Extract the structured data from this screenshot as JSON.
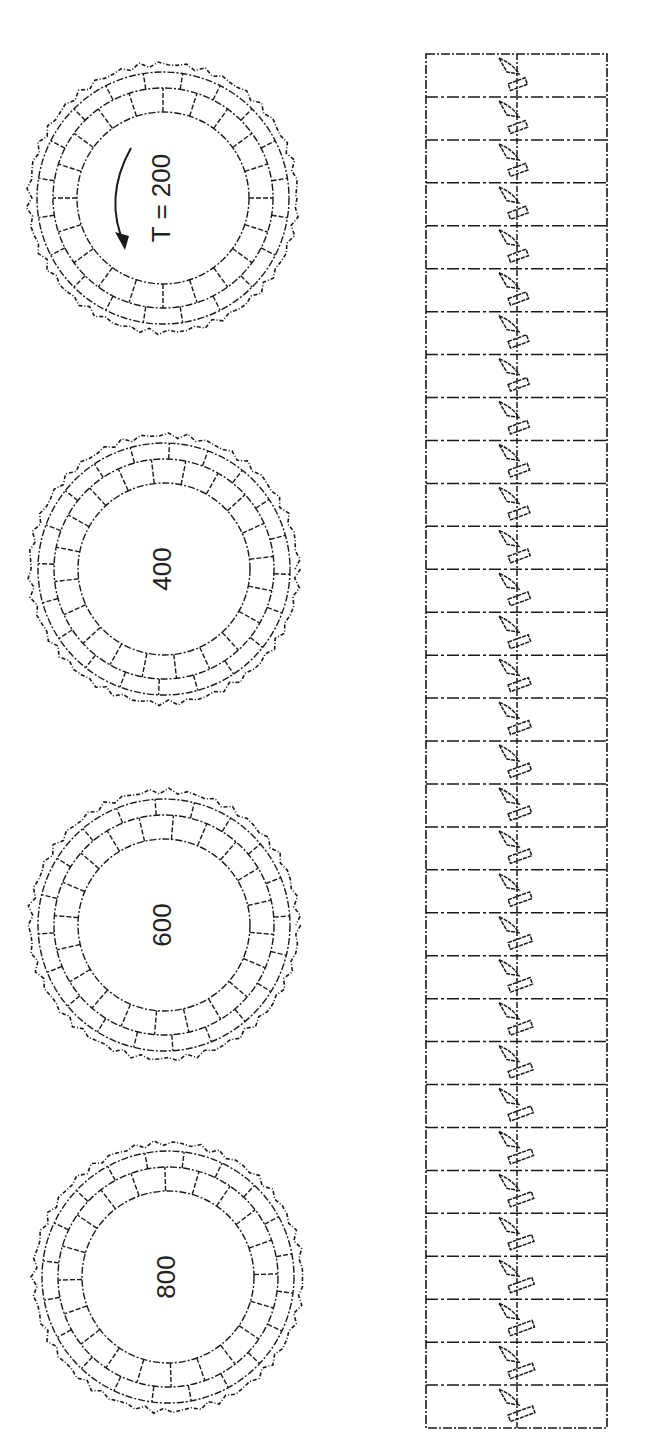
{
  "figure": {
    "rings": [
      {
        "label": "T = 200",
        "cx": 163,
        "cy": 198,
        "r_outer": 134,
        "r_mid": 110,
        "r_inner": 86,
        "segments": 20,
        "has_rotation_arrow": true
      },
      {
        "label": "400",
        "cx": 164,
        "cy": 569,
        "r_outer": 134,
        "r_mid": 110,
        "r_inner": 86,
        "segments": 20,
        "has_rotation_arrow": false
      },
      {
        "label": "600",
        "cx": 164,
        "cy": 925,
        "r_outer": 134,
        "r_mid": 110,
        "r_inner": 86,
        "segments": 20,
        "has_rotation_arrow": false
      },
      {
        "label": "800",
        "cx": 168,
        "cy": 1277,
        "r_outer": 134,
        "r_mid": 110,
        "r_inner": 86,
        "segments": 20,
        "has_rotation_arrow": false
      }
    ],
    "strip": {
      "x": 426,
      "y": 54,
      "width": 181,
      "height": 1374,
      "rows": 32,
      "axis_x": 517
    },
    "line_color": "#1a1a1a"
  }
}
